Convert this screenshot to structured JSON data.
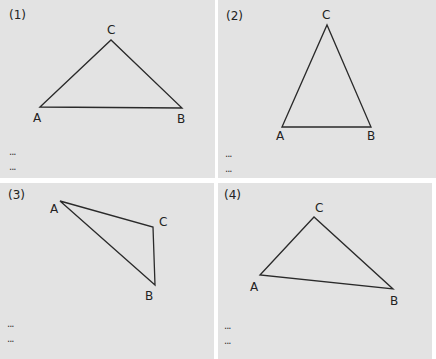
{
  "panels": [
    {
      "label": "(1)",
      "vertices": {
        "A": "A",
        "B": "B",
        "C": "C"
      },
      "dots": [
        "...",
        "..."
      ]
    },
    {
      "label": "(2)",
      "vertices": {
        "A": "A",
        "B": "B",
        "C": "C"
      },
      "dots": [
        "...",
        "..."
      ]
    },
    {
      "label": "(3)",
      "vertices": {
        "A": "A",
        "B": "B",
        "C": "C"
      },
      "dots": [
        "...",
        "..."
      ]
    },
    {
      "label": "(4)",
      "vertices": {
        "A": "A",
        "B": "B",
        "C": "C"
      },
      "dots": [
        "...",
        "..."
      ]
    }
  ],
  "colors": {
    "panel_bg": "#e3e3e3",
    "stroke": "#2a2a2a",
    "gap": "#ffffff"
  }
}
